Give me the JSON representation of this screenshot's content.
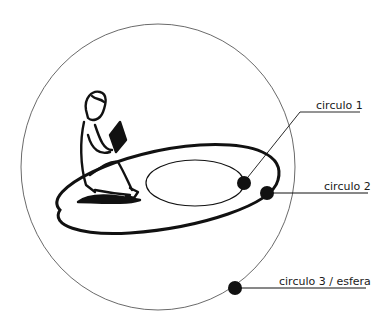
{
  "diagram": {
    "labels": {
      "circle1": "circulo 1",
      "circle2": "circulo 2",
      "circle3": "circulo 3 / esfera"
    },
    "figure": "child-reading-icon",
    "colors": {
      "ink": "#111111",
      "background": "#ffffff"
    }
  }
}
